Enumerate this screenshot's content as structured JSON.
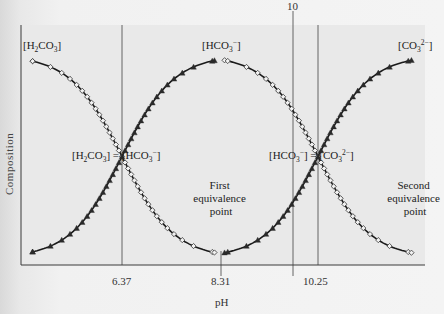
{
  "chart_data": {
    "type": "line",
    "title": "",
    "xlabel": "pH",
    "ylabel": "Composition",
    "xticks": [
      {
        "value": 6.37,
        "label": "6.37",
        "style": "full-line"
      },
      {
        "value": 8.31,
        "label": "8.31",
        "style": "tick"
      },
      {
        "value": 10.0,
        "label": "10",
        "style": "top-marker-line"
      },
      {
        "value": 10.25,
        "label": "10.25",
        "style": "full-line"
      }
    ],
    "grid": false,
    "legend": "none (curves labeled inline)",
    "series": [
      {
        "name": "[H2CO3]",
        "marker": "open-diamond",
        "segment": "first",
        "shape": "decreasing sigmoid",
        "points_pH_fraction": [
          [
            4.6,
            1.0
          ],
          [
            6.37,
            0.5
          ],
          [
            8.2,
            0.0
          ]
        ]
      },
      {
        "name": "[HCO3-] (formation)",
        "marker": "filled-triangle",
        "segment": "first",
        "shape": "increasing sigmoid",
        "points_pH_fraction": [
          [
            4.6,
            0.0
          ],
          [
            6.37,
            0.5
          ],
          [
            8.2,
            1.0
          ]
        ]
      },
      {
        "name": "[HCO3-] (consumption)",
        "marker": "open-diamond",
        "segment": "second",
        "shape": "decreasing sigmoid",
        "points_pH_fraction": [
          [
            8.4,
            1.0
          ],
          [
            10.25,
            0.5
          ],
          [
            12.1,
            0.0
          ]
        ]
      },
      {
        "name": "[CO3 2-]",
        "marker": "filled-triangle",
        "segment": "second",
        "shape": "increasing sigmoid",
        "points_pH_fraction": [
          [
            8.4,
            0.0
          ],
          [
            10.25,
            0.5
          ],
          [
            12.1,
            1.0
          ]
        ]
      }
    ],
    "annotations": [
      {
        "text": "[H2CO3] = [HCO3-]",
        "at_pH": 6.37,
        "fraction": 0.5
      },
      {
        "text": "[HCO3-] = [CO3 2-]",
        "at_pH": 10.25,
        "fraction": 0.5
      },
      {
        "text": "First equivalence point",
        "at_pH": 8.31
      },
      {
        "text": "Second equivalence point",
        "at_pH": 12.2
      }
    ]
  },
  "labels": {
    "ylabel": "Composition",
    "xlabel": "pH",
    "tick_637": "6.37",
    "tick_831": "8.31",
    "tick_1025": "10.25",
    "top_marker": "10",
    "h2co3_end": {
      "open": "[H",
      "sub1": "2",
      "mid": "CO",
      "sub2": "3",
      "close": "]"
    },
    "hco3_top": {
      "open": "[HCO",
      "sub": "3",
      "sup": "−",
      "close": "]"
    },
    "co3_end": {
      "open": "[CO",
      "sub": "3",
      "sup": "2−",
      "close": "]"
    },
    "cross1": {
      "a1": "[H",
      "a_sub1": "2",
      "a2": "CO",
      "a_sub2": "3",
      "a3": "] = ",
      "b1": "[HCO",
      "b_sub": "3",
      "b_sup": "−",
      "b2": "]"
    },
    "cross2": {
      "a1": "[HCO",
      "a_sub": "3",
      "a_sup": "−",
      "a2": "] = ",
      "b1": "[CO",
      "b_sub": "3",
      "b_sup": "2−",
      "b2": "]"
    },
    "first_eq": [
      "First",
      "equivalence",
      "point"
    ],
    "second_eq": [
      "Second",
      "equivalence",
      "point"
    ]
  },
  "colors": {
    "plot_background": "#e9e9e9",
    "page_background": "#f2f2f2",
    "curve": "#1a1a1a",
    "diamond_fill": "#f2f2f2",
    "triangle_fill": "#2a2a2a"
  }
}
